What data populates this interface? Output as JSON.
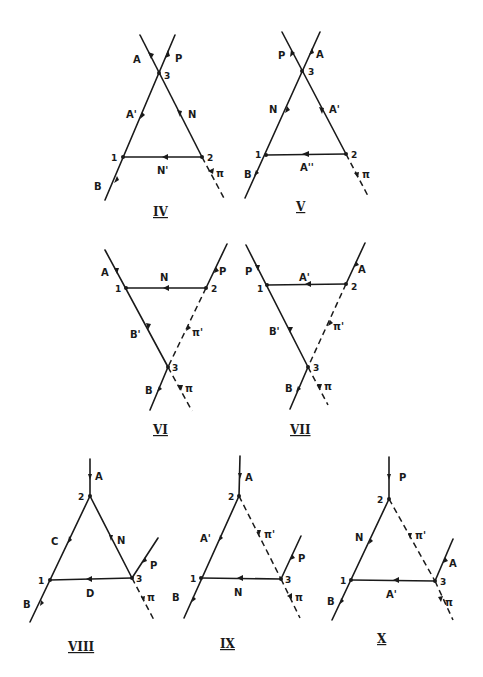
{
  "diagrams": [
    {
      "id": "IV",
      "caption": "IV",
      "vertices": {
        "1": "1",
        "2": "2",
        "3": "3"
      },
      "lines": {
        "A": "A",
        "P": "P",
        "A_prime": "A'",
        "N": "N",
        "N_prime": "N'",
        "B": "B",
        "pi": "π"
      }
    },
    {
      "id": "V",
      "caption": "V",
      "vertices": {
        "1": "1",
        "2": "2",
        "3": "3"
      },
      "lines": {
        "P": "P",
        "A": "A",
        "N": "N",
        "A_prime": "A'",
        "A_dprime": "A''",
        "B": "B",
        "pi": "π"
      }
    },
    {
      "id": "VI",
      "caption": "VI",
      "vertices": {
        "1": "1",
        "2": "2",
        "3": "3"
      },
      "lines": {
        "A": "A",
        "P": "P",
        "N": "N",
        "B_prime": "B'",
        "pi_prime": "π'",
        "B": "B",
        "pi": "π"
      }
    },
    {
      "id": "VII",
      "caption": "VII",
      "vertices": {
        "1": "1",
        "2": "2",
        "3": "3"
      },
      "lines": {
        "P": "P",
        "A": "A",
        "A_prime": "A'",
        "B_prime": "B'",
        "pi_prime": "π'",
        "B": "B",
        "pi": "π"
      }
    },
    {
      "id": "VIII",
      "caption": "VIII",
      "vertices": {
        "1": "1",
        "2": "2",
        "3": "3"
      },
      "lines": {
        "A": "A",
        "C": "C",
        "N": "N",
        "P": "P",
        "D": "D",
        "B": "B",
        "pi": "π"
      }
    },
    {
      "id": "IX",
      "caption": "IX",
      "vertices": {
        "1": "1",
        "2": "2",
        "3": "3"
      },
      "lines": {
        "A": "A",
        "A_prime": "A'",
        "pi_prime": "π'",
        "P": "P",
        "N": "N",
        "B": "B",
        "pi": "π"
      }
    },
    {
      "id": "X",
      "caption": "X",
      "vertices": {
        "1": "1",
        "2": "2",
        "3": "3"
      },
      "lines": {
        "P": "P",
        "N": "N",
        "pi_prime": "π'",
        "A": "A",
        "A_prime": "A'",
        "B": "B",
        "pi": "π"
      }
    }
  ]
}
